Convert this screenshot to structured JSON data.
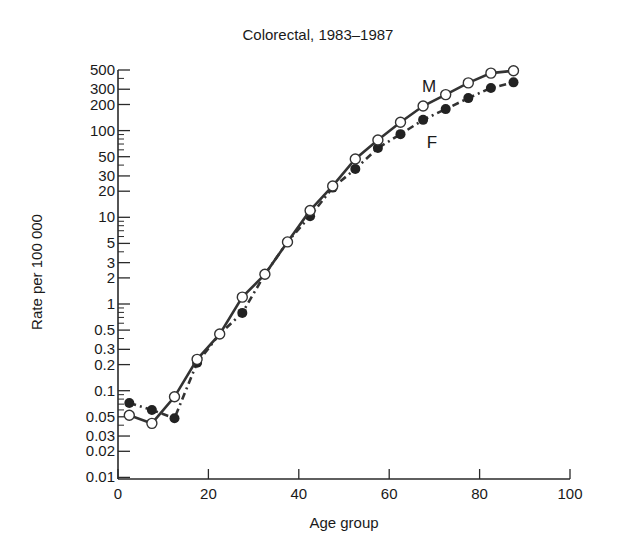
{
  "chart_data": {
    "type": "line",
    "title": "Colorectal, 1983–1987",
    "xlabel": "Age group",
    "ylabel": "Rate per 100 000",
    "xlim": [
      0,
      100
    ],
    "ylim": [
      0.01,
      500
    ],
    "yscale": "log",
    "grid": false,
    "xticks": [
      0,
      20,
      40,
      60,
      80,
      100
    ],
    "yticks": [
      500,
      300,
      200,
      100,
      50,
      30,
      20,
      10,
      5,
      3,
      2,
      1,
      0.5,
      0.3,
      0.2,
      0.1,
      0.05,
      0.03,
      0.02,
      0.01
    ],
    "ytick_labels": [
      "500",
      "300",
      "200",
      "100",
      "50",
      "30",
      "20",
      "10",
      "5",
      "3",
      "2",
      "1",
      "0.5",
      "0.3",
      "0.2",
      "0.1",
      "0.05",
      "0.03",
      "0.02",
      "0.01"
    ],
    "x": [
      2.5,
      7.5,
      12.5,
      17.5,
      22.5,
      27.5,
      32.5,
      37.5,
      42.5,
      47.5,
      52.5,
      57.5,
      62.5,
      67.5,
      72.5,
      77.5,
      82.5,
      87.5
    ],
    "series": [
      {
        "name": "M",
        "label": "M",
        "style": "solid",
        "marker": "open-circle",
        "values": [
          0.052,
          0.042,
          0.085,
          0.23,
          0.45,
          1.2,
          2.2,
          5.2,
          12,
          23,
          47,
          78,
          125,
          192,
          260,
          355,
          460,
          490
        ]
      },
      {
        "name": "F",
        "label": "F",
        "style": "dash-dot",
        "marker": "filled-circle",
        "values": [
          0.072,
          0.06,
          0.048,
          0.21,
          0.45,
          0.79,
          2.2,
          5.2,
          10.3,
          22,
          36,
          63,
          91,
          133,
          177,
          237,
          310,
          360
        ]
      }
    ],
    "annotations": [
      {
        "text": "M",
        "x": 74,
        "y": 360
      },
      {
        "text": "F",
        "x": 70,
        "y": 70
      }
    ]
  }
}
